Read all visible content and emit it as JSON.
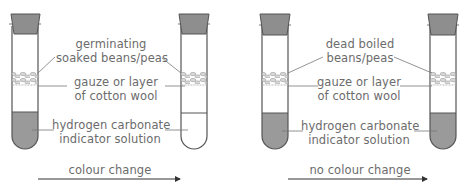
{
  "colors": {
    "tube_outline": "#555555",
    "stopper_fill": "#8e8e8e",
    "indicator_fill": "#9a9a9a",
    "changed_indicator_fill": "#ffffff",
    "label_text": "#6b6b6b",
    "leader_line": "#777777",
    "arrow": "#333333"
  },
  "experiments": [
    {
      "name": "germinating",
      "label_seeds_line1": "germinating",
      "label_seeds_line2": "soaked beans/peas",
      "label_gauze_line1": "gauze or layer",
      "label_gauze_line2": "of cotton wool",
      "label_solution_line1": "hydrogen carbonate",
      "label_solution_line2": "indicator solution",
      "arrow_label": "colour change",
      "before_tube": "indicator coloured",
      "after_tube": "indicator changed colour"
    },
    {
      "name": "dead-boiled",
      "label_seeds_line1": "dead boiled",
      "label_seeds_line2": "beans/peas",
      "label_gauze_line1": "gauze or layer",
      "label_gauze_line2": "of cotton wool",
      "label_solution_line1": "hydrogen carbonate",
      "label_solution_line2": "indicator solution",
      "arrow_label": "no colour change",
      "before_tube": "indicator coloured",
      "after_tube": "indicator unchanged"
    }
  ]
}
